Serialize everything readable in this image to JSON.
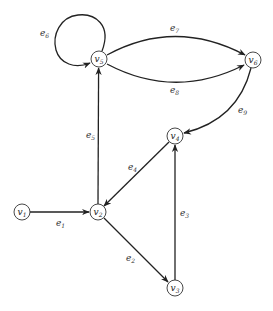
{
  "diagram": {
    "type": "directed-graph",
    "nodes": [
      {
        "id": "v1",
        "base": "v",
        "sub": "1",
        "x": 22,
        "y": 212
      },
      {
        "id": "v2",
        "base": "v",
        "sub": "2",
        "x": 98,
        "y": 212
      },
      {
        "id": "v3",
        "base": "v",
        "sub": "3",
        "x": 175,
        "y": 288
      },
      {
        "id": "v4",
        "base": "v",
        "sub": "4",
        "x": 175,
        "y": 136
      },
      {
        "id": "v5",
        "base": "v",
        "sub": "5",
        "x": 99,
        "y": 59
      },
      {
        "id": "v6",
        "base": "v",
        "sub": "6",
        "x": 253,
        "y": 60
      }
    ],
    "node_radius": 8,
    "edges": [
      {
        "id": "e1",
        "base": "e",
        "sub": "1",
        "from": "v1",
        "to": "v2",
        "label_x": 56,
        "label_y": 226
      },
      {
        "id": "e2",
        "base": "e",
        "sub": "2",
        "from": "v2",
        "to": "v3",
        "label_x": 126,
        "label_y": 261
      },
      {
        "id": "e3",
        "base": "e",
        "sub": "3",
        "from": "v3",
        "to": "v4",
        "label_x": 180,
        "label_y": 216
      },
      {
        "id": "e4",
        "base": "e",
        "sub": "4",
        "from": "v4",
        "to": "v2",
        "label_x": 128,
        "label_y": 170
      },
      {
        "id": "e5",
        "base": "e",
        "sub": "5",
        "from": "v2",
        "to": "v5",
        "label_x": 86,
        "label_y": 138
      },
      {
        "id": "e6",
        "base": "e",
        "sub": "6",
        "from": "v5",
        "to": "v5",
        "loop": true,
        "label_x": 40,
        "label_y": 36
      },
      {
        "id": "e7",
        "base": "e",
        "sub": "7",
        "from": "v5",
        "to": "v6",
        "curve": "up",
        "label_x": 170,
        "label_y": 31
      },
      {
        "id": "e8",
        "base": "e",
        "sub": "8",
        "from": "v5",
        "to": "v6",
        "curve": "down",
        "label_x": 170,
        "label_y": 93
      },
      {
        "id": "e9",
        "base": "e",
        "sub": "9",
        "from": "v6",
        "to": "v4",
        "curve": "arc",
        "label_x": 238,
        "label_y": 113
      }
    ]
  }
}
